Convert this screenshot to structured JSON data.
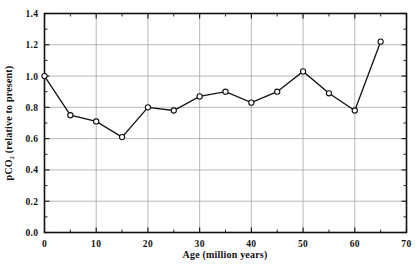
{
  "chart_data": {
    "type": "line",
    "title": "",
    "subtitle": "",
    "xlabel": "Age (million years)",
    "ylabel": "pCO2 (relative to present)",
    "ylabel_display": "pCO₂ (relative to present)",
    "xlim": [
      0,
      70
    ],
    "ylim": [
      0.0,
      1.4
    ],
    "xticks": [
      0,
      10,
      20,
      30,
      40,
      50,
      60,
      70
    ],
    "xtick_labels": [
      "0",
      "10",
      "20",
      "30",
      "40",
      "50",
      "60",
      "70"
    ],
    "x_minor_tick_interval": 5,
    "yticks": [
      0.0,
      0.2,
      0.4,
      0.6,
      0.8,
      1.0,
      1.2,
      1.4
    ],
    "ytick_labels": [
      "0.0",
      "0.2",
      "0.4",
      "0.6",
      "0.8",
      "1.0",
      "1.2",
      "1.4"
    ],
    "y_minor_tick_interval": 0.1,
    "grid": true,
    "grid_axes": "both",
    "legend": null,
    "legend_position": "none",
    "marker": "open-circle",
    "line_color": "#111111",
    "marker_fill": "#ffffff",
    "grid_color": "#9a9a9a",
    "frame_color": "#111111",
    "background": "#ffffff",
    "x": [
      0,
      5,
      10,
      15,
      20,
      25,
      30,
      35,
      40,
      45,
      50,
      55,
      60,
      65
    ],
    "values": [
      1.0,
      0.75,
      0.71,
      0.61,
      0.8,
      0.78,
      0.87,
      0.9,
      0.83,
      0.9,
      1.03,
      0.89,
      0.78,
      1.22
    ],
    "points": [
      {
        "x": 0,
        "y": 1.0
      },
      {
        "x": 5,
        "y": 0.75
      },
      {
        "x": 10,
        "y": 0.71
      },
      {
        "x": 15,
        "y": 0.61
      },
      {
        "x": 20,
        "y": 0.8
      },
      {
        "x": 25,
        "y": 0.78
      },
      {
        "x": 30,
        "y": 0.87
      },
      {
        "x": 35,
        "y": 0.9
      },
      {
        "x": 40,
        "y": 0.83
      },
      {
        "x": 45,
        "y": 0.9
      },
      {
        "x": 50,
        "y": 1.03
      },
      {
        "x": 55,
        "y": 0.89
      },
      {
        "x": 60,
        "y": 0.78
      },
      {
        "x": 65,
        "y": 1.22
      }
    ]
  }
}
